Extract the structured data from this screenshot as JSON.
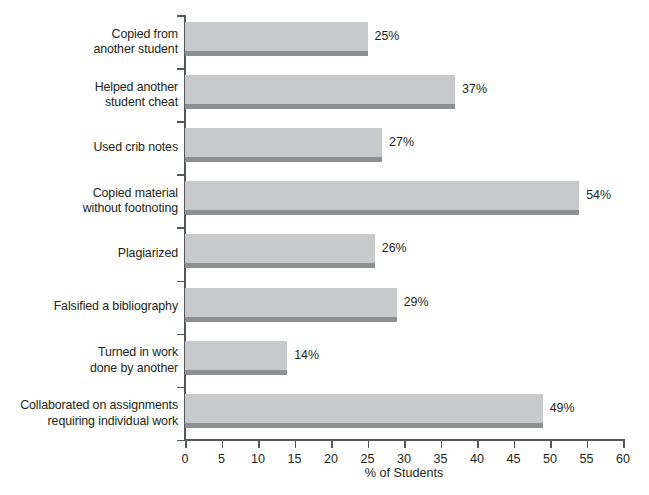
{
  "chart_data": {
    "type": "bar",
    "orientation": "horizontal",
    "title": "",
    "xlabel": "% of Students",
    "ylabel": "",
    "xlim": [
      0,
      60
    ],
    "xticks": [
      0,
      5,
      10,
      15,
      20,
      25,
      30,
      35,
      40,
      45,
      50,
      55,
      60
    ],
    "xtick_labels": [
      "0",
      "5",
      "10",
      "15",
      "20",
      "25",
      "30",
      "35",
      "40",
      "45",
      "50",
      "55",
      "60"
    ],
    "grid": false,
    "legend": null,
    "categories": [
      "Copied from\nanother student",
      "Helped another\nstudent cheat",
      "Used crib notes",
      "Copied material\nwithout footnoting",
      "Plagiarized",
      "Falsified a bibliography",
      "Turned in work\ndone by another",
      "Collaborated on assignments\nrequiring individual work"
    ],
    "values": [
      25,
      37,
      27,
      54,
      26,
      29,
      14,
      49
    ],
    "value_labels": [
      "25%",
      "37%",
      "27%",
      "54%",
      "26%",
      "29%",
      "14%",
      "49%"
    ],
    "colors": {
      "bar_fill": "#c8c9cb",
      "bar_shadow": "#8d9093",
      "axis": "#55585a",
      "text": "#231f20",
      "background": "#ffffff"
    }
  }
}
